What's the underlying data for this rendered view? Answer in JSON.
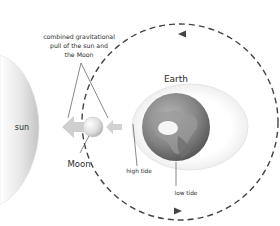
{
  "diagram": {
    "labels": {
      "sun": "sun",
      "moon": "Moon",
      "earth": "Earth",
      "high_tide": "high tide",
      "low_tide": "low tide",
      "combined_pull_line1": "combined gravitational",
      "combined_pull_line2": "pull of the sun and",
      "combined_pull_line3": "the Moon"
    },
    "elements": [
      {
        "name": "sun",
        "shape": "large crescent at left edge",
        "color": "#d6d6d6"
      },
      {
        "name": "moon",
        "shape": "small sphere",
        "color": "#e4e4e4"
      },
      {
        "name": "earth",
        "shape": "globe",
        "color": "#7a7a7a"
      },
      {
        "name": "tidal-bulge",
        "shape": "ellipse around earth",
        "color": "#eeeeee"
      },
      {
        "name": "moon-orbit",
        "shape": "dashed circle with arrows (counter-clockwise)",
        "color": "#444444"
      },
      {
        "name": "pull-arrow-large",
        "direction": "left",
        "color": "#cccccc"
      },
      {
        "name": "pull-arrow-small",
        "direction": "left",
        "color": "#cccccc"
      }
    ],
    "colors": {
      "sun": "#d9d9d9",
      "orbit": "#444444",
      "arrow": "#cfcfcf",
      "text": "#2a2a2a",
      "earth_dark": "#5a5a5a",
      "earth_light": "#a8a8a8"
    }
  }
}
